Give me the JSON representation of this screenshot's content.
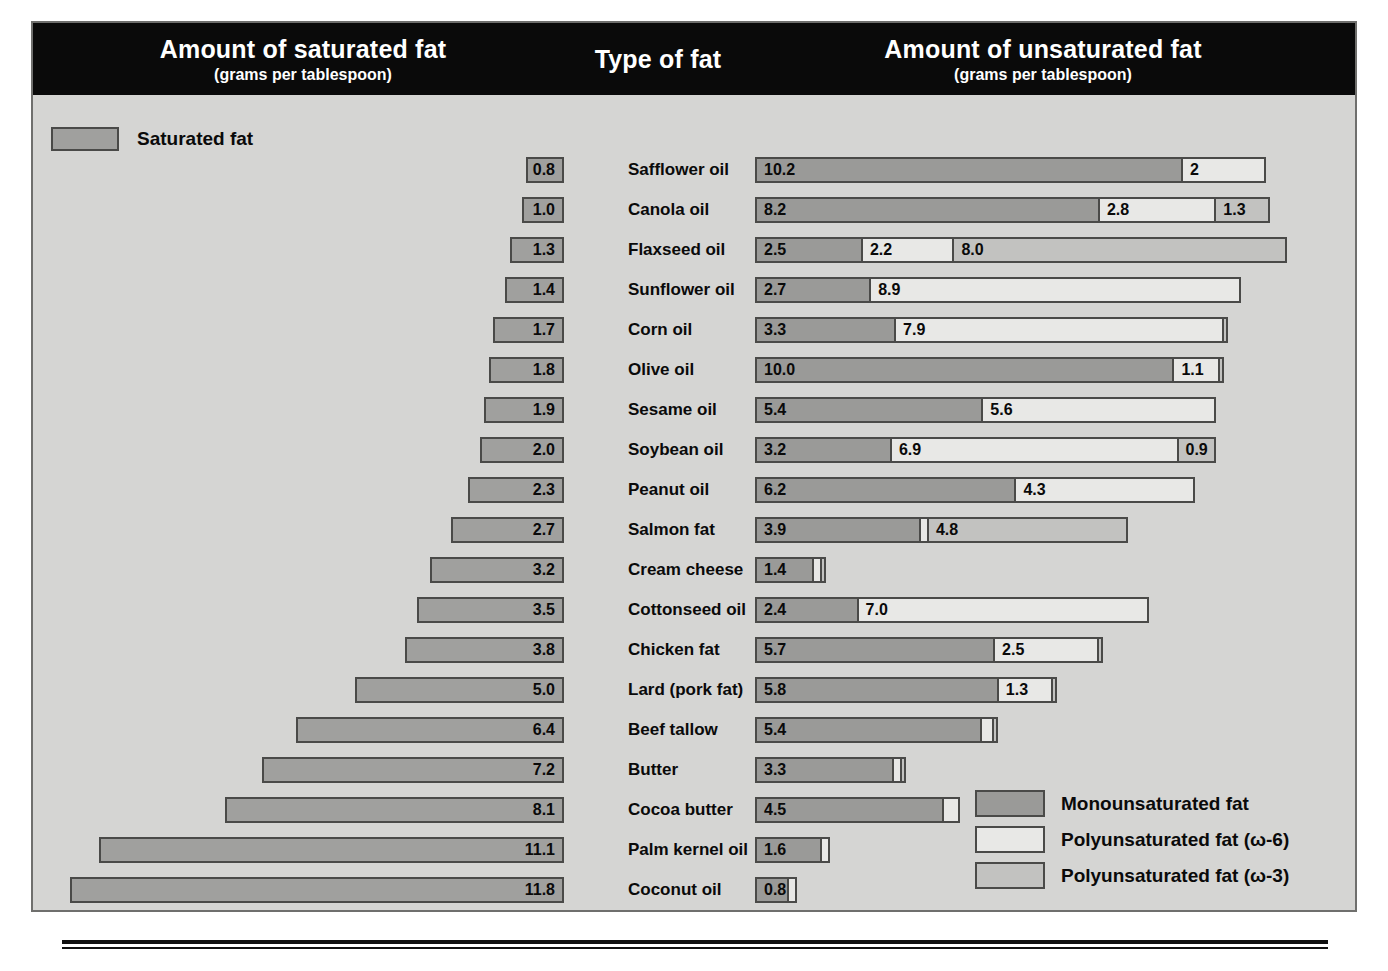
{
  "header": {
    "saturated_title": "Amount of saturated fat",
    "saturated_sub": "(grams per tablespoon)",
    "type_title": "Type of fat",
    "unsaturated_title": "Amount of unsaturated fat",
    "unsaturated_sub": "(grams per tablespoon)"
  },
  "saturated_legend": {
    "label": "Saturated fat",
    "color": "#a0a09e"
  },
  "legend": {
    "items": [
      {
        "label": "Monounsaturated fat",
        "color": "#9a9a98",
        "key": "mufa"
      },
      {
        "label": "Polyunsaturated fat (ω-6)",
        "color": "#e8e8e6",
        "key": "o6"
      },
      {
        "label": "Polyunsaturated fat (ω-3)",
        "color": "#c2c2c0",
        "key": "o3"
      }
    ]
  },
  "chart_data": {
    "type": "bar",
    "subtitle": "grams per tablespoon",
    "orientation": "horizontal-diverging-stacked",
    "xlabel_left": "Amount of saturated fat (grams per tablespoon)",
    "xlabel_right": "Amount of unsaturated fat (grams per tablespoon)",
    "category_label": "Type of fat",
    "units": "grams per tablespoon",
    "grid": false,
    "legend_position": "bottom-right",
    "series": [
      {
        "name": "Saturated fat",
        "key": "saturated",
        "color": "#a0a09e"
      },
      {
        "name": "Monounsaturated fat",
        "key": "mufa",
        "color": "#9a9a98"
      },
      {
        "name": "Polyunsaturated fat (ω-6)",
        "key": "omega6",
        "color": "#e8e8e6"
      },
      {
        "name": "Polyunsaturated fat (ω-3)",
        "key": "omega3",
        "color": "#c2c2c0"
      }
    ],
    "categories": [
      "Safflower oil",
      "Canola oil",
      "Flaxseed oil",
      "Sunflower oil",
      "Corn oil",
      "Olive oil",
      "Sesame oil",
      "Soybean oil",
      "Peanut oil",
      "Salmon fat",
      "Cream cheese",
      "Cottonseed oil",
      "Chicken fat",
      "Lard (pork fat)",
      "Beef tallow",
      "Butter",
      "Cocoa butter",
      "Palm kernel oil",
      "Coconut oil"
    ],
    "rows": [
      {
        "name": "Safflower oil",
        "saturated": 0.8,
        "saturated_label": "0.8",
        "segments": [
          {
            "key": "mufa",
            "value": 10.2,
            "label": "10.2"
          },
          {
            "key": "o6",
            "value": 2.0,
            "label": "2"
          }
        ]
      },
      {
        "name": "Canola oil",
        "saturated": 1.0,
        "saturated_label": "1.0",
        "segments": [
          {
            "key": "mufa",
            "value": 8.2,
            "label": "8.2"
          },
          {
            "key": "o6",
            "value": 2.8,
            "label": "2.8"
          },
          {
            "key": "o3",
            "value": 1.3,
            "label": "1.3"
          }
        ]
      },
      {
        "name": "Flaxseed oil",
        "saturated": 1.3,
        "saturated_label": "1.3",
        "segments": [
          {
            "key": "mufa",
            "value": 2.5,
            "label": "2.5"
          },
          {
            "key": "o6",
            "value": 2.2,
            "label": "2.2"
          },
          {
            "key": "o3",
            "value": 8.0,
            "label": "8.0"
          }
        ]
      },
      {
        "name": "Sunflower oil",
        "saturated": 1.4,
        "saturated_label": "1.4",
        "segments": [
          {
            "key": "mufa",
            "value": 2.7,
            "label": "2.7"
          },
          {
            "key": "o6",
            "value": 8.9,
            "label": "8.9"
          }
        ]
      },
      {
        "name": "Corn oil",
        "saturated": 1.7,
        "saturated_label": "1.7",
        "segments": [
          {
            "key": "mufa",
            "value": 3.3,
            "label": "3.3"
          },
          {
            "key": "o6",
            "value": 7.9,
            "label": "7.9"
          },
          {
            "key": "o3",
            "value": 0.1,
            "label": ""
          }
        ]
      },
      {
        "name": "Olive oil",
        "saturated": 1.8,
        "saturated_label": "1.8",
        "segments": [
          {
            "key": "mufa",
            "value": 10.0,
            "label": "10.0"
          },
          {
            "key": "o6",
            "value": 1.1,
            "label": "1.1"
          },
          {
            "key": "o3",
            "value": 0.1,
            "label": ""
          }
        ]
      },
      {
        "name": "Sesame oil",
        "saturated": 1.9,
        "saturated_label": "1.9",
        "segments": [
          {
            "key": "mufa",
            "value": 5.4,
            "label": "5.4"
          },
          {
            "key": "o6",
            "value": 5.6,
            "label": "5.6"
          }
        ]
      },
      {
        "name": "Soybean oil",
        "saturated": 2.0,
        "saturated_label": "2.0",
        "segments": [
          {
            "key": "mufa",
            "value": 3.2,
            "label": "3.2"
          },
          {
            "key": "o6",
            "value": 6.9,
            "label": "6.9"
          },
          {
            "key": "o3",
            "value": 0.9,
            "label": "0.9"
          }
        ]
      },
      {
        "name": "Peanut oil",
        "saturated": 2.3,
        "saturated_label": "2.3",
        "segments": [
          {
            "key": "mufa",
            "value": 6.2,
            "label": "6.2"
          },
          {
            "key": "o6",
            "value": 4.3,
            "label": "4.3"
          }
        ]
      },
      {
        "name": "Salmon fat",
        "saturated": 2.7,
        "saturated_label": "2.7",
        "segments": [
          {
            "key": "mufa",
            "value": 3.9,
            "label": "3.9"
          },
          {
            "key": "o6",
            "value": 0.2,
            "label": ""
          },
          {
            "key": "o3",
            "value": 4.8,
            "label": "4.8"
          }
        ]
      },
      {
        "name": "Cream cheese",
        "saturated": 3.2,
        "saturated_label": "3.2",
        "segments": [
          {
            "key": "mufa",
            "value": 1.4,
            "label": "1.4"
          },
          {
            "key": "o6",
            "value": 0.2,
            "label": ""
          },
          {
            "key": "o3",
            "value": 0.1,
            "label": ""
          }
        ]
      },
      {
        "name": "Cottonseed oil",
        "saturated": 3.5,
        "saturated_label": "3.5",
        "segments": [
          {
            "key": "mufa",
            "value": 2.4,
            "label": "2.4"
          },
          {
            "key": "o6",
            "value": 7.0,
            "label": "7.0"
          }
        ]
      },
      {
        "name": "Chicken fat",
        "saturated": 3.8,
        "saturated_label": "3.8",
        "segments": [
          {
            "key": "mufa",
            "value": 5.7,
            "label": "5.7"
          },
          {
            "key": "o6",
            "value": 2.5,
            "label": "2.5"
          },
          {
            "key": "o3",
            "value": 0.1,
            "label": ""
          }
        ]
      },
      {
        "name": "Lard (pork fat)",
        "saturated": 5.0,
        "saturated_label": "5.0",
        "segments": [
          {
            "key": "mufa",
            "value": 5.8,
            "label": "5.8"
          },
          {
            "key": "o6",
            "value": 1.3,
            "label": "1.3"
          },
          {
            "key": "o3",
            "value": 0.1,
            "label": ""
          }
        ]
      },
      {
        "name": "Beef tallow",
        "saturated": 6.4,
        "saturated_label": "6.4",
        "segments": [
          {
            "key": "mufa",
            "value": 5.4,
            "label": "5.4"
          },
          {
            "key": "o6",
            "value": 0.3,
            "label": ""
          },
          {
            "key": "o3",
            "value": 0.1,
            "label": ""
          }
        ]
      },
      {
        "name": "Butter",
        "saturated": 7.2,
        "saturated_label": "7.2",
        "segments": [
          {
            "key": "mufa",
            "value": 3.3,
            "label": "3.3"
          },
          {
            "key": "o6",
            "value": 0.2,
            "label": ""
          },
          {
            "key": "o3",
            "value": 0.1,
            "label": ""
          }
        ]
      },
      {
        "name": "Cocoa butter",
        "saturated": 8.1,
        "saturated_label": "8.1",
        "segments": [
          {
            "key": "mufa",
            "value": 4.5,
            "label": "4.5"
          },
          {
            "key": "o6",
            "value": 0.4,
            "label": ""
          }
        ]
      },
      {
        "name": "Palm kernel oil",
        "saturated": 11.1,
        "saturated_label": "11.1",
        "segments": [
          {
            "key": "mufa",
            "value": 1.6,
            "label": "1.6"
          },
          {
            "key": "o6",
            "value": 0.2,
            "label": ""
          }
        ]
      },
      {
        "name": "Coconut oil",
        "saturated": 11.8,
        "saturated_label": "11.8",
        "segments": [
          {
            "key": "mufa",
            "value": 0.8,
            "label": "0.8"
          },
          {
            "key": "o6",
            "value": 0.2,
            "label": ""
          }
        ]
      }
    ]
  },
  "layout": {
    "px_per_gram": 41.9,
    "sat_right_edge": 531,
    "unsat_left_edge": 722,
    "row_height": 40,
    "first_row_top": 55
  }
}
